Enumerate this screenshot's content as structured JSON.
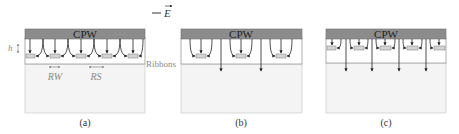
{
  "legend": {
    "symbol": "—",
    "label": "E"
  },
  "colors": {
    "cpw": "#8c8c8c",
    "cpw_border": "#6e6e6e",
    "ribbon_fill": "#d4d4d4",
    "ribbon_region_border": "#9a9a9a",
    "substrate_fill": "#f4f4f4",
    "substrate_border": "#d0d0d0",
    "arrow": "#222222",
    "dim": "#8a8a8a",
    "text": "#333333",
    "dim_text": "#8a8a8a"
  },
  "panels": [
    {
      "id": "a",
      "caption": "(a)",
      "cpw_label": "CPW",
      "annotations": {
        "h": "h",
        "rw": "RW",
        "rs": "RS",
        "ribbons": "Ribbons"
      }
    },
    {
      "id": "b",
      "caption": "(b)",
      "cpw_label": "CPW"
    },
    {
      "id": "c",
      "caption": "(c)",
      "cpw_label": "CPW"
    }
  ]
}
